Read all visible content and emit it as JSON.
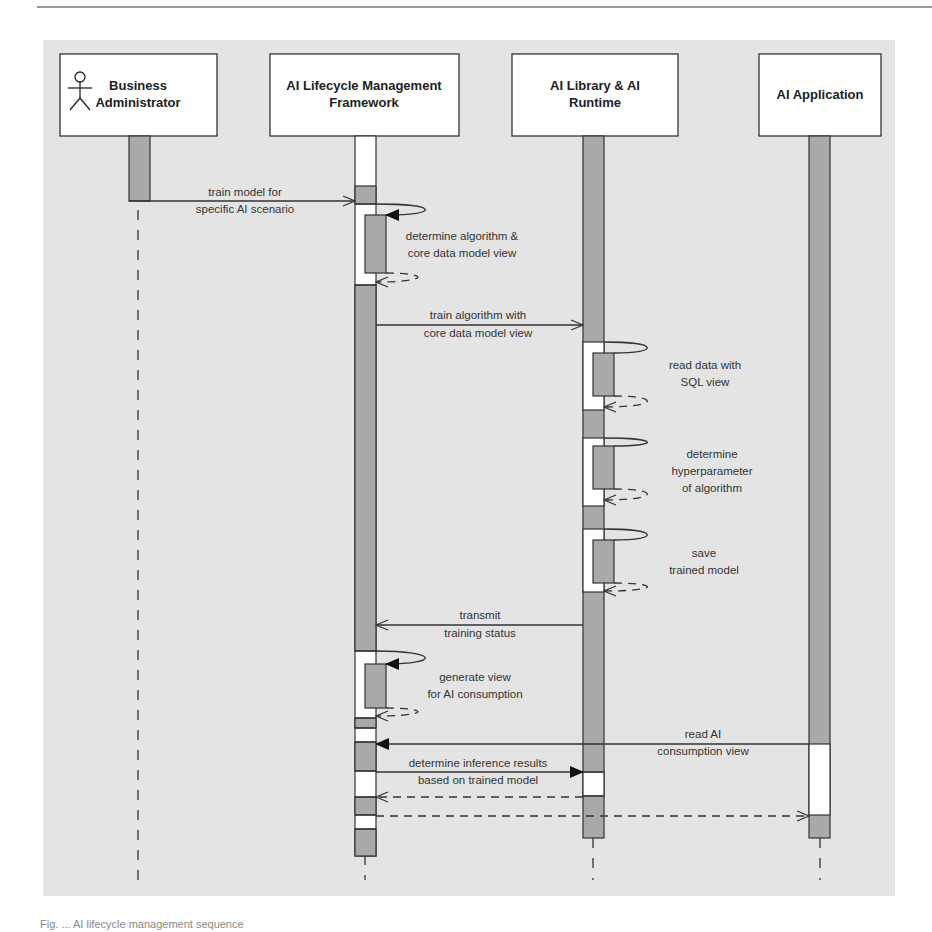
{
  "participants": [
    {
      "id": "business-administrator",
      "line1": "Business",
      "line2": "Administrator",
      "actor": true
    },
    {
      "id": "ai-lifecycle-management-framework",
      "line1": "AI Lifecycle Management",
      "line2": "Framework"
    },
    {
      "id": "ai-library-ai-runtime",
      "line1": "AI Library & AI",
      "line2": "Runtime"
    },
    {
      "id": "ai-application",
      "line1": "AI Application",
      "line2": ""
    }
  ],
  "messages": [
    {
      "line1": "train model for",
      "line2": "specific AI scenario",
      "from": "Business Administrator",
      "to": "AI Lifecycle Management Framework",
      "type": "sync"
    },
    {
      "line1": "determine algorithm &",
      "line2": "core data model view",
      "from": "AI Lifecycle Management Framework",
      "to": "AI Lifecycle Management Framework",
      "type": "self"
    },
    {
      "line1": "train algorithm with",
      "line2": "core data model view",
      "from": "AI Lifecycle Management Framework",
      "to": "AI Library & AI Runtime",
      "type": "sync"
    },
    {
      "line1": "read data with",
      "line2": "SQL view",
      "from": "AI Library & AI Runtime",
      "to": "AI Library & AI Runtime",
      "type": "self"
    },
    {
      "line1": "determine",
      "line2": "hyperparameter",
      "line3": "of algorithm",
      "from": "AI Library & AI Runtime",
      "to": "AI Library & AI Runtime",
      "type": "self"
    },
    {
      "line1": "save",
      "line2": "trained model",
      "from": "AI Library & AI Runtime",
      "to": "AI Library & AI Runtime",
      "type": "self"
    },
    {
      "line1": "transmit",
      "line2": "training status",
      "from": "AI Library & AI Runtime",
      "to": "AI Lifecycle Management Framework",
      "type": "async"
    },
    {
      "line1": "generate view",
      "line2": "for AI consumption",
      "from": "AI Lifecycle Management Framework",
      "to": "AI Lifecycle Management Framework",
      "type": "self"
    },
    {
      "line1": "read AI",
      "line2": "consumption view",
      "from": "AI Application",
      "to": "AI Lifecycle Management Framework",
      "type": "sync"
    },
    {
      "line1": "determine inference results",
      "line2": "based on trained model",
      "from": "AI Lifecycle Management Framework",
      "to": "AI Library & AI Runtime",
      "type": "sync"
    },
    {
      "line1": "",
      "from": "AI Library & AI Runtime",
      "to": "AI Lifecycle Management Framework",
      "type": "return"
    },
    {
      "line1": "",
      "from": "AI Lifecycle Management Framework",
      "to": "AI Application",
      "type": "return"
    }
  ],
  "caption": "Fig. ... AI lifecycle management sequence"
}
